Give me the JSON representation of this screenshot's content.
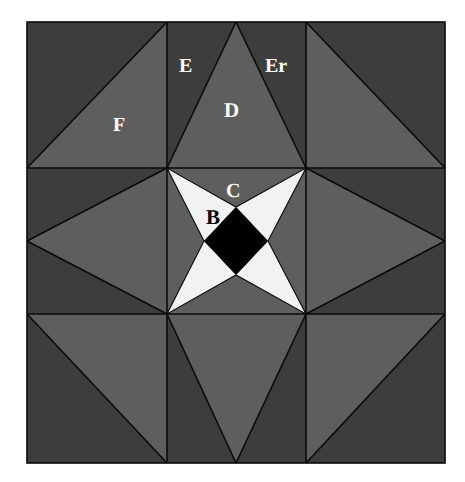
{
  "figure": {
    "title": "",
    "background_color": "#ffffff",
    "frame": {
      "x": 27,
      "y": 22,
      "width": 418,
      "height": 441
    },
    "grid": {
      "columns": 3,
      "rows": 3,
      "cell_width": 139.33,
      "cell_height": 147,
      "vertical_lines_x": [
        168,
        306
      ],
      "horizontal_lines_y": [
        168,
        314
      ],
      "line_color": "#0a0a0a",
      "line_width": 1.6
    },
    "colors": {
      "dark_gray": "#3d3d3d",
      "medium_gray": "#5e5e5e",
      "white": "#f2f2f2",
      "black": "#000000",
      "outline": "#0a0a0a",
      "page_white": "#ffffff"
    },
    "labels": [
      {
        "id": "label-A",
        "text": "A",
        "x": 239,
        "y": 240,
        "size": 22,
        "color": "black",
        "region": "central-black-diamond"
      },
      {
        "id": "label-B",
        "text": "B",
        "x": 213,
        "y": 219,
        "size": 21,
        "color": "black",
        "region": "star-upper-left-arm"
      },
      {
        "id": "label-C",
        "text": "C",
        "x": 232,
        "y": 192,
        "size": 20,
        "color": "white",
        "region": "center-cell-upper-gray"
      },
      {
        "id": "label-D",
        "text": "D",
        "x": 231,
        "y": 111,
        "size": 21,
        "color": "white",
        "region": "top-middle-up-triangle"
      },
      {
        "id": "label-E",
        "text": "E",
        "x": 185,
        "y": 67,
        "size": 20,
        "color": "white",
        "region": "top-middle-left-triangle"
      },
      {
        "id": "label-Er",
        "text": "Er",
        "x": 273,
        "y": 67,
        "size": 20,
        "color": "white",
        "region": "top-middle-right-triangle"
      },
      {
        "id": "label-F",
        "text": "F",
        "x": 119,
        "y": 126,
        "size": 20,
        "color": "white",
        "region": "top-left-lower-triangle"
      }
    ],
    "regions": {
      "corner_cells": [
        {
          "name": "top-left",
          "diagonal": "tr-bl",
          "light_half": "lower-left"
        },
        {
          "name": "top-right",
          "diagonal": "tl-br",
          "light_half": "lower-left"
        },
        {
          "name": "bottom-left",
          "diagonal": "tl-br",
          "light_half": "upper-right"
        },
        {
          "name": "bottom-right",
          "diagonal": "bl-tr",
          "light_half": "upper-left"
        }
      ],
      "edge_cells": [
        {
          "name": "top-middle",
          "triangle_points": "down-apex-top",
          "label": "D"
        },
        {
          "name": "middle-left",
          "triangle_points": "left",
          "label": ""
        },
        {
          "name": "middle-right",
          "triangle_points": "right",
          "label": ""
        },
        {
          "name": "bottom-middle",
          "triangle_points": "down",
          "label": ""
        }
      ],
      "center_cell": {
        "name": "center",
        "shape": "four-pointed-star",
        "star_fill": "white",
        "core": {
          "shape": "diamond",
          "fill": "black",
          "label": "A"
        },
        "background_fill": "medium_gray"
      }
    }
  }
}
